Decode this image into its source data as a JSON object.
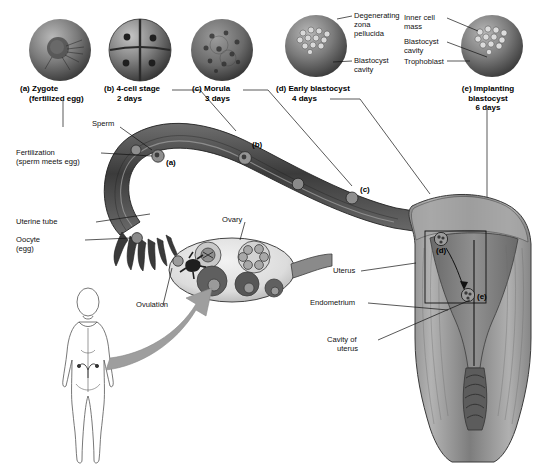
{
  "figure": {
    "background": "#ffffff",
    "ink": "#111111",
    "tissue_dark": "#4a4a4a",
    "tissue_mid": "#8d8d8d",
    "tissue_light": "#c9c9c9",
    "arrow_gray": "#9a9a9a"
  },
  "panels": [
    {
      "id": "a",
      "caption_line1": "(a) Zygote",
      "caption_line2": "(fertilized egg)",
      "marker": "(a)"
    },
    {
      "id": "b",
      "caption_line1": "(b) 4-cell stage",
      "caption_line2": "2 days",
      "marker": "(b)"
    },
    {
      "id": "c",
      "caption_line1": "(c) Morula",
      "caption_line2": "3 days",
      "marker": "(c)"
    },
    {
      "id": "d",
      "caption_line1": "(d) Early blastocyst",
      "caption_line2": "4 days",
      "marker": "(d)"
    },
    {
      "id": "e",
      "caption_line1": "(e) Implanting",
      "caption_line2": "blastocyst",
      "caption_line3": "6 days",
      "marker": "(e)"
    }
  ],
  "panel_d_labels": {
    "zona_line1": "Degenerating",
    "zona_line2": "zona",
    "zona_line3": "pellucida",
    "cavity_line1": "Blastocyst",
    "cavity_line2": "cavity"
  },
  "panel_e_labels": {
    "icm_line1": "Inner cell",
    "icm_line2": "mass",
    "cavity_line1": "Blastocyst",
    "cavity_line2": "cavity",
    "trophoblast": "Trophoblast"
  },
  "main_labels": {
    "sperm": "Sperm",
    "fertilization_line1": "Fertilization",
    "fertilization_line2": "(sperm meets egg)",
    "uterine_tube": "Uterine tube",
    "oocyte_line1": "Oocyte",
    "oocyte_line2": "(egg)",
    "ovary": "Ovary",
    "ovulation": "Ovulation",
    "uterus": "Uterus",
    "endometrium": "Endometrium",
    "cavity_line1": "Cavity of",
    "cavity_line2": "uterus"
  }
}
